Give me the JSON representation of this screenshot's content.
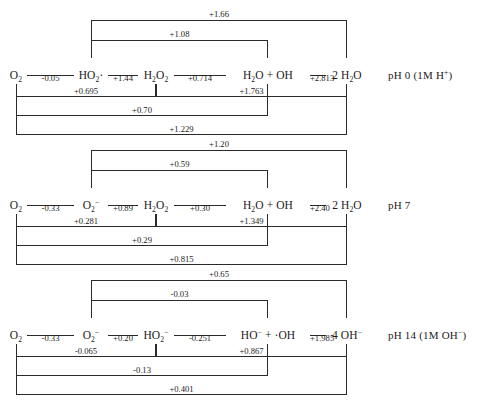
{
  "figure": {
    "type": "latimer-diagram-set"
  },
  "chart_data": {
    "type": "diagram",
    "title": "",
    "xlabel": "",
    "ylabel": "",
    "units": "V",
    "panels": [
      {
        "ph_label": "pH 0  (1M H+)",
        "ph_value": 0,
        "condition": "1M H+",
        "species": [
          "O2",
          "HO2·",
          "H2O2",
          "H2O + OH",
          "2 H2O"
        ],
        "steps": [
          {
            "from": 0,
            "to": 1,
            "value": "-0.05"
          },
          {
            "from": 1,
            "to": 2,
            "value": "+1.44"
          },
          {
            "from": 2,
            "to": 3,
            "value": "+0.714"
          },
          {
            "from": 3,
            "to": 4,
            "value": "+2.813"
          }
        ],
        "spans_above": [
          {
            "from": 1,
            "to": 4,
            "value": "+1.66",
            "level": 2
          },
          {
            "from": 1,
            "to": 3,
            "value": "+1.08",
            "level": 1
          }
        ],
        "spans_below": [
          {
            "from": 0,
            "to": 2,
            "value": "+0.695",
            "level": 1
          },
          {
            "from": 2,
            "to": 4,
            "value": "+1.763",
            "level": 1
          },
          {
            "from": 0,
            "to": 3,
            "value": "+0.70",
            "level": 2
          },
          {
            "from": 0,
            "to": 4,
            "value": "+1.229",
            "level": 3
          }
        ]
      },
      {
        "ph_label": "pH 7",
        "ph_value": 7,
        "condition": "",
        "species": [
          "O2",
          "O2-",
          "H2O2",
          "H2O + OH",
          "2 H2O"
        ],
        "steps": [
          {
            "from": 0,
            "to": 1,
            "value": "-0.33"
          },
          {
            "from": 1,
            "to": 2,
            "value": "+0.89"
          },
          {
            "from": 2,
            "to": 3,
            "value": "+0.30"
          },
          {
            "from": 3,
            "to": 4,
            "value": "+2.40"
          }
        ],
        "spans_above": [
          {
            "from": 1,
            "to": 4,
            "value": "+1.20",
            "level": 2
          },
          {
            "from": 1,
            "to": 3,
            "value": "+0.59",
            "level": 1
          }
        ],
        "spans_below": [
          {
            "from": 0,
            "to": 2,
            "value": "+0.281",
            "level": 1
          },
          {
            "from": 2,
            "to": 4,
            "value": "+1.349",
            "level": 1
          },
          {
            "from": 0,
            "to": 3,
            "value": "+0.29",
            "level": 2
          },
          {
            "from": 0,
            "to": 4,
            "value": "+0.815",
            "level": 3
          }
        ]
      },
      {
        "ph_label": "pH 14  (1M OH-)",
        "ph_value": 14,
        "condition": "1M OH-",
        "species": [
          "O2",
          "O2-",
          "HO2-",
          "HO- + ·OH",
          "4 OH-"
        ],
        "steps": [
          {
            "from": 0,
            "to": 1,
            "value": "-0.33"
          },
          {
            "from": 1,
            "to": 2,
            "value": "+0.20"
          },
          {
            "from": 2,
            "to": 3,
            "value": "-0.251"
          },
          {
            "from": 3,
            "to": 4,
            "value": "+1.985"
          }
        ],
        "spans_above": [
          {
            "from": 1,
            "to": 4,
            "value": "+0.65",
            "level": 2
          },
          {
            "from": 1,
            "to": 3,
            "value": "-0.03",
            "level": 1
          }
        ],
        "spans_below": [
          {
            "from": 0,
            "to": 2,
            "value": "-0.065",
            "level": 1
          },
          {
            "from": 2,
            "to": 4,
            "value": "+0.867",
            "level": 1
          },
          {
            "from": 0,
            "to": 3,
            "value": "-0.13",
            "level": 2
          },
          {
            "from": 0,
            "to": 4,
            "value": "+0.401",
            "level": 3
          }
        ]
      }
    ]
  },
  "style": {
    "line_color": "#2a2a2a",
    "text_color": "#1b1b1b",
    "background": "#ffffff"
  }
}
